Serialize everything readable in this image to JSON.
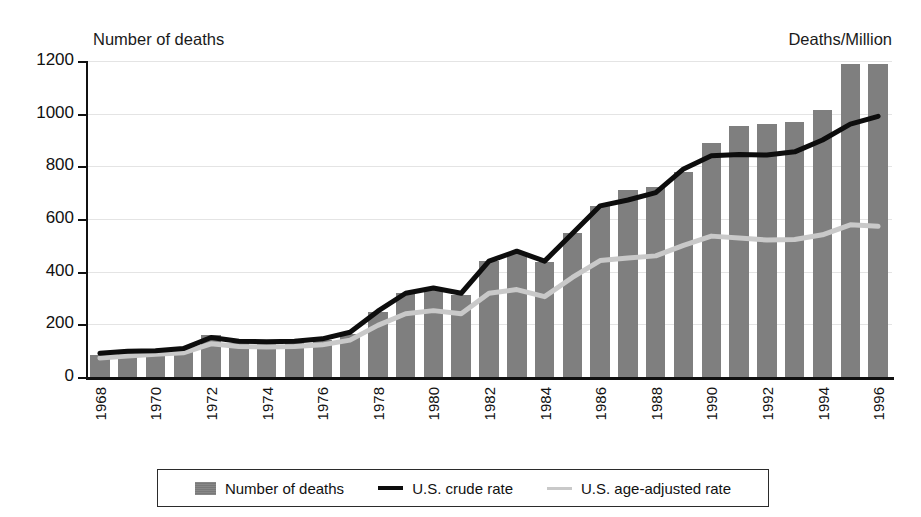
{
  "axes": {
    "left_title": "Number of deaths",
    "right_title": "Deaths/Million",
    "y_ticks": [
      "1200",
      "1000",
      "800",
      "600",
      "400",
      "200",
      "0"
    ],
    "x_tick_labels": [
      "1968",
      "1970",
      "1972",
      "1974",
      "1976",
      "1978",
      "1980",
      "1982",
      "1984",
      "1986",
      "1988",
      "1990",
      "1992",
      "1994",
      "1996"
    ]
  },
  "legend": {
    "items": [
      {
        "label": "Number of deaths",
        "marker": "bar-swatch",
        "color": "#7f7f7f"
      },
      {
        "label": "U.S. crude rate",
        "marker": "line-dark",
        "color": "#0d0d0d"
      },
      {
        "label": "U.S. age-adjusted rate",
        "marker": "line-light",
        "color": "#c9c9c9"
      }
    ]
  },
  "chart_data": {
    "type": "bar",
    "title": "",
    "xlabel": "",
    "ylabel": "Number of deaths",
    "y2label": "Deaths/Million",
    "ylim": [
      0,
      1200
    ],
    "grid": true,
    "legend_position": "bottom",
    "categories": [
      "1968",
      "1969",
      "1970",
      "1971",
      "1972",
      "1973",
      "1974",
      "1975",
      "1976",
      "1977",
      "1978",
      "1979",
      "1980",
      "1981",
      "1982",
      "1983",
      "1984",
      "1985",
      "1986",
      "1987",
      "1988",
      "1989",
      "1990",
      "1991",
      "1992",
      "1993",
      "1994",
      "1995",
      "1996"
    ],
    "series": [
      {
        "name": "Number of deaths",
        "type": "bar",
        "axis": "left",
        "color": "#7f7f7f",
        "values": [
          85,
          95,
          100,
          105,
          160,
          130,
          130,
          130,
          140,
          165,
          245,
          320,
          335,
          310,
          440,
          470,
          435,
          545,
          650,
          710,
          720,
          780,
          890,
          955,
          960,
          970,
          1015,
          1190,
          1190
        ]
      },
      {
        "name": "U.S. crude rate",
        "type": "line",
        "axis": "right",
        "color": "#0d0d0d",
        "values": [
          90,
          98,
          100,
          108,
          150,
          136,
          134,
          136,
          145,
          170,
          250,
          318,
          338,
          318,
          440,
          478,
          440,
          545,
          650,
          672,
          700,
          790,
          840,
          845,
          843,
          855,
          900,
          960,
          990
        ]
      },
      {
        "name": "U.S. age-adjusted rate",
        "type": "line",
        "axis": "right",
        "color": "#c9c9c9",
        "values": [
          72,
          80,
          86,
          92,
          126,
          116,
          114,
          116,
          122,
          140,
          196,
          240,
          252,
          240,
          318,
          332,
          305,
          378,
          442,
          452,
          460,
          500,
          535,
          528,
          520,
          522,
          540,
          578,
          572
        ]
      }
    ]
  }
}
